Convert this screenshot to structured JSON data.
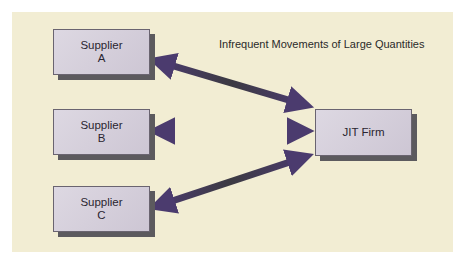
{
  "diagram": {
    "title": "Infrequent Movements of Large Quantities",
    "suppliers": [
      {
        "name": "Supplier",
        "letter": "A"
      },
      {
        "name": "Supplier",
        "letter": "B"
      },
      {
        "name": "Supplier",
        "letter": "C"
      }
    ],
    "firm": {
      "name": "JIT Firm"
    },
    "colors": {
      "background": "#f2edd3",
      "box": "#d6d0dc",
      "arrow": "#4b3b6e",
      "shadow": "#5c5a5e"
    },
    "connections": [
      {
        "from": "Supplier A",
        "to": "JIT Firm",
        "bidirectional": true
      },
      {
        "from": "Supplier B",
        "to": "JIT Firm",
        "bidirectional": true
      },
      {
        "from": "Supplier C",
        "to": "JIT Firm",
        "bidirectional": true
      }
    ]
  }
}
